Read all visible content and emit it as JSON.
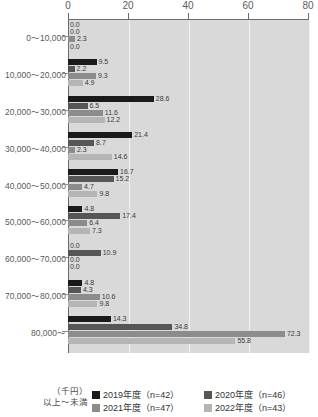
{
  "chart_data": {
    "type": "bar",
    "orientation": "horizontal",
    "title": "",
    "xlabel": "",
    "ylabel": "",
    "xlim": [
      0,
      80
    ],
    "xticks": [
      0,
      20,
      40,
      60,
      80
    ],
    "grid": true,
    "legend_position": "bottom",
    "unit_note_line1": "（千円）",
    "unit_note_line2": "以上～未満",
    "categories": [
      "0～10,000",
      "10,000～20,000",
      "20,000～30,000",
      "30,000～40,000",
      "40,000～50,000",
      "50,000～60,000",
      "60,000～70,000",
      "70,000～80,000",
      "80,000～"
    ],
    "series": [
      {
        "name": "2019年度（n=42）",
        "color": "#1a1a1a",
        "values": [
          0.0,
          9.5,
          28.6,
          21.4,
          16.7,
          4.8,
          0.0,
          4.8,
          14.3
        ],
        "labels": [
          "0.0",
          "9.5",
          "28.6",
          "21.4",
          "16.7",
          "4.8",
          "0.0",
          "4.8",
          "14.3"
        ]
      },
      {
        "name": "2020年度（n=46）",
        "color": "#565656",
        "values": [
          0.0,
          2.2,
          6.5,
          8.7,
          15.2,
          17.4,
          10.9,
          4.3,
          34.8
        ],
        "labels": [
          "0.0",
          "2.2",
          "6.5",
          "8.7",
          "15.2",
          "17.4",
          "10.9",
          "4.3",
          "34.8"
        ]
      },
      {
        "name": "2021年度（n=47）",
        "color": "#8c8c8c",
        "values": [
          2.3,
          9.3,
          11.6,
          2.3,
          4.7,
          6.4,
          0.0,
          10.6,
          72.3
        ],
        "labels": [
          "2.3",
          "9.3",
          "11.6",
          "2.3",
          "4.7",
          "6.4",
          "0.0",
          "10.6",
          "72.3"
        ]
      },
      {
        "name": "2022年度（n=43）",
        "color": "#b5b5b5",
        "values": [
          0.0,
          4.9,
          12.2,
          14.6,
          9.8,
          7.3,
          0.0,
          9.8,
          55.8
        ],
        "labels": [
          "0.0",
          "4.9",
          "12.2",
          "14.6",
          "9.8",
          "7.3",
          "0.0",
          "9.8",
          "55.8"
        ]
      }
    ]
  }
}
